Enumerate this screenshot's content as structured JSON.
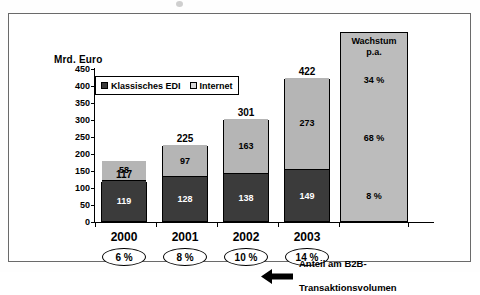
{
  "chart_data": {
    "type": "bar",
    "subtype": "stacked-vertical",
    "title": "",
    "xlabel": "",
    "ylabel": "Mrd. Euro",
    "ylim": [
      0,
      450
    ],
    "ytick_step": 50,
    "yticks": [
      "450",
      "400",
      "350",
      "300",
      "250",
      "200",
      "150",
      "100",
      "50",
      "0"
    ],
    "grid": false,
    "legend_position": "top-left-inside",
    "categories": [
      "2000",
      "2001",
      "2002",
      "2003"
    ],
    "series": [
      {
        "name": "Klassisches EDI",
        "color": "#3b3b3b",
        "values": [
          119,
          128,
          138,
          149
        ]
      },
      {
        "name": "Internet",
        "color": "#b5b5b5",
        "values": [
          58,
          97,
          163,
          273
        ]
      }
    ],
    "totals": [
      117,
      225,
      301,
      422
    ],
    "annotations": {
      "share_label": "Anteil am B2B-\nTransaktionsvolumen",
      "share_values": [
        "6 %",
        "8 %",
        "10 %",
        "14 %"
      ]
    },
    "growth_column": {
      "header_line1": "Wachstum",
      "header_line2": "p.a.",
      "entries": [
        {
          "label": "34 %",
          "series": "Internet"
        },
        {
          "label": "68 %",
          "series": "total"
        },
        {
          "label": "8 %",
          "series": "Klassisches EDI"
        }
      ]
    }
  },
  "axis": {
    "y_title": "Mrd. Euro"
  },
  "legend": {
    "items": [
      {
        "label": "Klassisches EDI"
      },
      {
        "label": "Internet"
      }
    ]
  },
  "bars": [
    {
      "year": "2000",
      "total": "117",
      "internet": "58",
      "edi": "119",
      "share": "6 %"
    },
    {
      "year": "2001",
      "total": "225",
      "internet": "97",
      "edi": "128",
      "share": "8 %"
    },
    {
      "year": "2002",
      "total": "301",
      "internet": "163",
      "edi": "138",
      "share": "10 %"
    },
    {
      "year": "2003",
      "total": "422",
      "internet": "273",
      "edi": "149",
      "share": "14 %"
    }
  ],
  "growth": {
    "header_line1": "Wachstum",
    "header_line2": "p.a.",
    "v1": "34 %",
    "v2": "68 %",
    "v3": "8 %"
  },
  "annotation": {
    "line1": "Anteil am B2B-",
    "line2": "Transaktionsvolumen"
  },
  "colors": {
    "edi": "#3b3b3b",
    "internet": "#b5b5b5",
    "growth_fill": "#bcbcbc",
    "frame": "#6a6a6a"
  }
}
